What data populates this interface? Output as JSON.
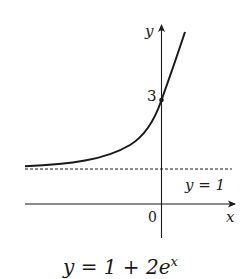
{
  "diagram": {
    "caption": "y = 1 + 2e",
    "caption_exponent": "x",
    "axes": {
      "x_label": "x",
      "y_label": "y",
      "origin_label": "0"
    },
    "y_intercept_label": "3",
    "asymptote_label": "y = 1",
    "colors": {
      "ink": "#1a1a1a",
      "background": "#ffffff"
    }
  }
}
